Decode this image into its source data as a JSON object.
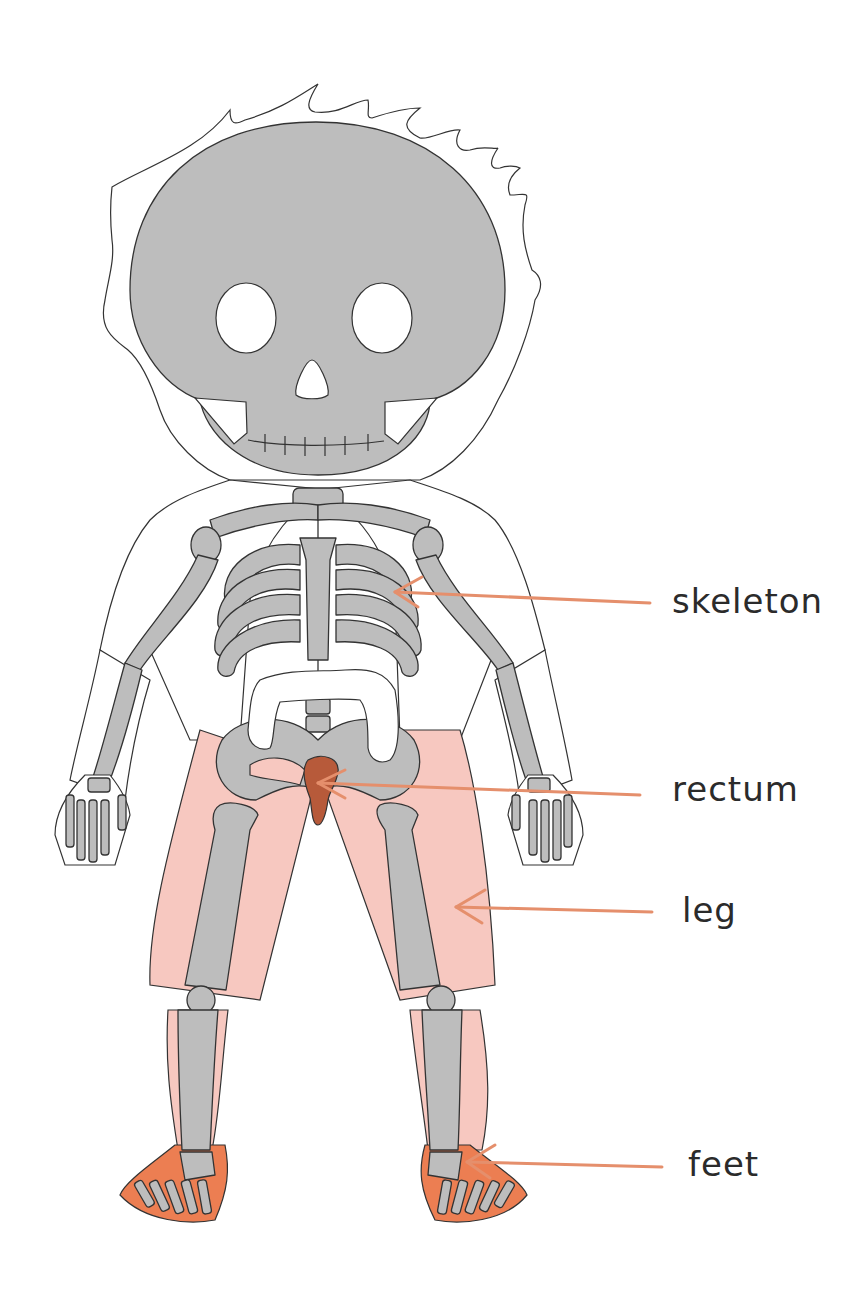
{
  "labels": [
    {
      "id": "skeleton",
      "text": "skeleton",
      "target": "ribcage",
      "arrow_color": "#e58f6c"
    },
    {
      "id": "rectum",
      "text": "rectum",
      "target": "rectum",
      "arrow_color": "#e58f6c"
    },
    {
      "id": "leg",
      "text": "leg",
      "target": "right thigh",
      "arrow_color": "#e58f6c"
    },
    {
      "id": "feet",
      "text": "feet",
      "target": "right foot",
      "arrow_color": "#e58f6c"
    }
  ],
  "colors": {
    "bone": "#bdbdbd",
    "leg_highlight": "#f7c8c0",
    "feet_highlight": "#ec7e52",
    "rectum": "#b75a3a",
    "arrow": "#e58f6c",
    "text": "#2b2b2b",
    "outline": "#333333"
  }
}
